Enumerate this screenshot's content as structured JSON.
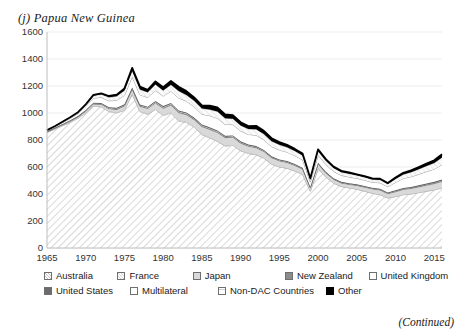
{
  "figure": {
    "panel_title": "(j) Papua New Guinea",
    "continued_note": "(Continued)"
  },
  "chart_data": {
    "type": "area",
    "stacked": true,
    "title": "(j) Papua New Guinea",
    "xlabel": "",
    "ylabel": "",
    "xlim": [
      1965,
      2016
    ],
    "ylim": [
      0,
      1600
    ],
    "ytick_values": [
      0,
      200,
      400,
      600,
      800,
      1000,
      1200,
      1400,
      1600
    ],
    "ytick_labels": [
      "0",
      "200",
      "400",
      "600",
      "800",
      "1000",
      "1200",
      "1400",
      "1600"
    ],
    "xtick_values": [
      1965,
      1970,
      1975,
      1980,
      1985,
      1990,
      1995,
      2000,
      2005,
      2010,
      2015
    ],
    "xtick_labels": [
      "1965",
      "1970",
      "1975",
      "1980",
      "1985",
      "1990",
      "1995",
      "2000",
      "2005",
      "2010",
      "2015"
    ],
    "grid": "horizontal-light",
    "legend_position": "bottom",
    "x": [
      1965,
      1966,
      1967,
      1968,
      1969,
      1970,
      1971,
      1972,
      1973,
      1974,
      1975,
      1976,
      1977,
      1978,
      1979,
      1980,
      1981,
      1982,
      1983,
      1984,
      1985,
      1986,
      1987,
      1988,
      1989,
      1990,
      1991,
      1992,
      1993,
      1994,
      1995,
      1996,
      1997,
      1998,
      1999,
      2000,
      2001,
      2002,
      2003,
      2004,
      2005,
      2006,
      2007,
      2008,
      2009,
      2010,
      2011,
      2012,
      2013,
      2014,
      2015,
      2016
    ],
    "series": [
      {
        "name": "Australia",
        "pattern": "diagonal-hatch",
        "color": "#f2f2f2",
        "values": [
          855,
          880,
          905,
          930,
          960,
          1000,
          1050,
          1045,
          1010,
          1000,
          1020,
          1140,
          1010,
          990,
          1025,
          980,
          1000,
          940,
          930,
          895,
          840,
          815,
          790,
          755,
          760,
          720,
          700,
          690,
          665,
          620,
          600,
          590,
          570,
          545,
          420,
          590,
          525,
          480,
          455,
          445,
          435,
          420,
          405,
          395,
          370,
          380,
          395,
          400,
          410,
          420,
          430,
          445
        ]
      },
      {
        "name": "France",
        "pattern": "light-hatch",
        "color": "#fafafa",
        "values": [
          2,
          2,
          3,
          3,
          3,
          4,
          4,
          4,
          4,
          4,
          5,
          5,
          5,
          5,
          5,
          6,
          6,
          6,
          5,
          5,
          5,
          5,
          5,
          4,
          4,
          4,
          4,
          4,
          4,
          4,
          3,
          3,
          3,
          3,
          2,
          2,
          2,
          2,
          2,
          2,
          2,
          2,
          2,
          2,
          2,
          2,
          2,
          2,
          2,
          2,
          2,
          2
        ]
      },
      {
        "name": "Japan",
        "pattern": "solid-light-gray",
        "color": "#d9d9d9",
        "values": [
          3,
          4,
          5,
          6,
          7,
          9,
          12,
          15,
          18,
          22,
          26,
          30,
          34,
          38,
          44,
          48,
          52,
          56,
          52,
          50,
          54,
          58,
          60,
          58,
          56,
          52,
          50,
          48,
          46,
          44,
          42,
          40,
          38,
          36,
          22,
          30,
          28,
          26,
          24,
          24,
          26,
          28,
          30,
          32,
          30,
          34,
          36,
          38,
          40,
          42,
          44,
          46
        ]
      },
      {
        "name": "New Zealand",
        "pattern": "solid-mid-gray",
        "color": "#8c8c8c",
        "values": [
          1,
          1,
          1,
          2,
          2,
          2,
          3,
          3,
          3,
          3,
          4,
          4,
          4,
          4,
          4,
          5,
          5,
          5,
          5,
          5,
          5,
          5,
          5,
          5,
          5,
          5,
          4,
          4,
          4,
          4,
          4,
          4,
          4,
          4,
          3,
          3,
          3,
          3,
          3,
          3,
          3,
          4,
          4,
          4,
          4,
          5,
          5,
          5,
          5,
          6,
          6,
          6
        ]
      },
      {
        "name": "United Kingdom",
        "pattern": "white-outline",
        "color": "#ffffff",
        "values": [
          2,
          2,
          3,
          3,
          3,
          4,
          4,
          4,
          4,
          5,
          5,
          5,
          5,
          5,
          5,
          6,
          6,
          6,
          6,
          5,
          5,
          5,
          5,
          4,
          4,
          4,
          4,
          4,
          3,
          3,
          3,
          3,
          3,
          3,
          2,
          2,
          2,
          2,
          2,
          2,
          2,
          2,
          2,
          2,
          2,
          2,
          2,
          2,
          2,
          2,
          2,
          2
        ]
      },
      {
        "name": "United States",
        "pattern": "solid-dark-gray",
        "color": "#6b6b6b",
        "values": [
          1,
          1,
          2,
          2,
          2,
          3,
          3,
          3,
          3,
          4,
          4,
          4,
          5,
          5,
          5,
          6,
          6,
          6,
          6,
          6,
          6,
          6,
          6,
          5,
          5,
          5,
          5,
          5,
          4,
          4,
          4,
          4,
          4,
          4,
          3,
          4,
          4,
          4,
          4,
          4,
          4,
          4,
          4,
          4,
          4,
          5,
          5,
          5,
          5,
          6,
          6,
          6
        ]
      },
      {
        "name": "Multilateral",
        "pattern": "white-outline",
        "color": "#ffffff",
        "values": [
          6,
          8,
          10,
          14,
          18,
          26,
          34,
          42,
          48,
          56,
          66,
          80,
          72,
          68,
          80,
          74,
          86,
          92,
          84,
          80,
          76,
          86,
          90,
          84,
          80,
          76,
          74,
          80,
          76,
          72,
          70,
          66,
          62,
          58,
          36,
          56,
          54,
          50,
          48,
          46,
          44,
          42,
          40,
          44,
          42,
          58,
          70,
          76,
          82,
          88,
          94,
          110
        ]
      },
      {
        "name": "Non-DAC Countries",
        "pattern": "fine-hatch",
        "color": "#f7f7f7",
        "values": [
          2,
          3,
          4,
          6,
          8,
          12,
          18,
          22,
          26,
          30,
          36,
          44,
          40,
          38,
          44,
          42,
          48,
          52,
          46,
          44,
          42,
          46,
          50,
          46,
          44,
          42,
          40,
          44,
          42,
          40,
          38,
          36,
          34,
          32,
          20,
          30,
          28,
          26,
          24,
          24,
          22,
          22,
          20,
          22,
          20,
          26,
          30,
          34,
          38,
          42,
          46,
          54
        ]
      },
      {
        "name": "Other",
        "pattern": "solid-black",
        "color": "#000000",
        "values": [
          1,
          1,
          2,
          2,
          3,
          4,
          6,
          8,
          10,
          12,
          16,
          22,
          20,
          18,
          22,
          24,
          28,
          32,
          28,
          26,
          24,
          28,
          30,
          28,
          26,
          24,
          22,
          26,
          24,
          22,
          20,
          18,
          16,
          14,
          8,
          14,
          12,
          10,
          10,
          10,
          8,
          8,
          8,
          8,
          8,
          10,
          12,
          14,
          16,
          18,
          20,
          24
        ]
      }
    ],
    "peaks_note": [
      {
        "year": 1976,
        "total": 1340
      },
      {
        "year": 1972,
        "total": 1245
      },
      {
        "year": 1981,
        "total": 1290
      },
      {
        "year": 1999,
        "total": 520
      },
      {
        "year": 2016,
        "total": 700
      }
    ]
  },
  "legend": {
    "rows": [
      [
        {
          "label": "Australia",
          "swatch": "diagonal-hatch"
        },
        {
          "label": "France",
          "swatch": "light-hatch"
        },
        {
          "label": "Japan",
          "swatch": "solid-light-gray"
        },
        {
          "label": "New Zealand",
          "swatch": "solid-mid-gray"
        },
        {
          "label": "United Kingdom",
          "swatch": "white-outline"
        }
      ],
      [
        {
          "label": "United States",
          "swatch": "solid-dark-gray"
        },
        {
          "label": "Multilateral",
          "swatch": "white-outline"
        },
        {
          "label": "Non-DAC Countries",
          "swatch": "fine-hatch"
        },
        {
          "label": "Other",
          "swatch": "solid-black"
        }
      ]
    ]
  }
}
